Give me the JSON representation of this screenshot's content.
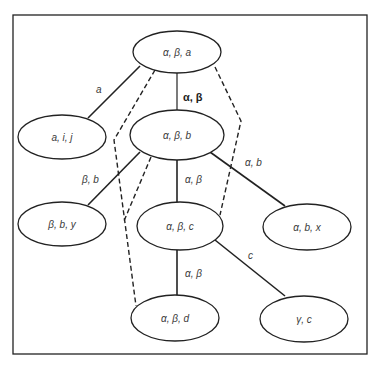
{
  "colors": {
    "stroke": "#222222",
    "text": "#3a3a3a",
    "background": "#ffffff"
  },
  "frame": {
    "x": 13,
    "y": 15,
    "w": 354,
    "h": 339
  },
  "nodes": [
    {
      "id": "n_aba",
      "label": "α, β, a",
      "cx": 177,
      "cy": 52,
      "rx": 44,
      "ry": 21
    },
    {
      "id": "n_aij",
      "label": "a, i, j",
      "cx": 62,
      "cy": 137,
      "rx": 44,
      "ry": 22
    },
    {
      "id": "n_abb",
      "label": "α, β, b",
      "cx": 177,
      "cy": 135,
      "rx": 47,
      "ry": 25
    },
    {
      "id": "n_bby",
      "label": "β, b, y",
      "cx": 62,
      "cy": 224,
      "rx": 44,
      "ry": 22
    },
    {
      "id": "n_abc",
      "label": "α, β, c",
      "cx": 180,
      "cy": 226,
      "rx": 43,
      "ry": 24
    },
    {
      "id": "n_abx",
      "label": "α, b, x",
      "cx": 307,
      "cy": 227,
      "rx": 44,
      "ry": 23
    },
    {
      "id": "n_abd",
      "label": "α, β, d",
      "cx": 175,
      "cy": 318,
      "rx": 44,
      "ry": 23
    },
    {
      "id": "n_gc",
      "label": "γ, c",
      "cx": 304,
      "cy": 319,
      "rx": 44,
      "ry": 23
    }
  ],
  "edges": [
    {
      "from": "n_aba",
      "to": "n_aij",
      "label": "a",
      "x1": 140,
      "y1": 66,
      "x2": 88,
      "y2": 118,
      "lx": 96,
      "ly": 93,
      "bold": false
    },
    {
      "from": "n_aba",
      "to": "n_abb",
      "label": "α, β",
      "x1": 177,
      "y1": 73,
      "x2": 177,
      "y2": 110,
      "lx": 183,
      "ly": 101,
      "bold": true
    },
    {
      "from": "n_abb",
      "to": "n_bby",
      "label": "β, b",
      "x1": 140,
      "y1": 152,
      "x2": 88,
      "y2": 205,
      "lx": 82,
      "ly": 183,
      "bold": false
    },
    {
      "from": "n_abb",
      "to": "n_abc",
      "label": "α, β",
      "x1": 177,
      "y1": 160,
      "x2": 177,
      "y2": 202,
      "lx": 185,
      "ly": 183,
      "bold": false
    },
    {
      "from": "n_abb",
      "to": "n_abx",
      "label": "α, b",
      "x1": 210,
      "y1": 152,
      "x2": 285,
      "y2": 206,
      "lx": 245,
      "ly": 166,
      "bold": false
    },
    {
      "from": "n_abc",
      "to": "n_abd",
      "label": "α, β",
      "x1": 177,
      "y1": 250,
      "x2": 177,
      "y2": 295,
      "lx": 185,
      "ly": 277,
      "bold": false
    },
    {
      "from": "n_abc",
      "to": "n_gc",
      "label": "c",
      "x1": 215,
      "y1": 240,
      "x2": 285,
      "y2": 296,
      "lx": 248,
      "ly": 259,
      "bold": false
    }
  ],
  "dashed_paths": [
    {
      "id": "dash_top_to_d",
      "points": "155,70 114,140 136,306"
    },
    {
      "id": "dash_b_to_cross",
      "points": "151,157 124,221"
    },
    {
      "id": "dash_top_to_c",
      "points": "215,67 241,121 220,215"
    }
  ]
}
